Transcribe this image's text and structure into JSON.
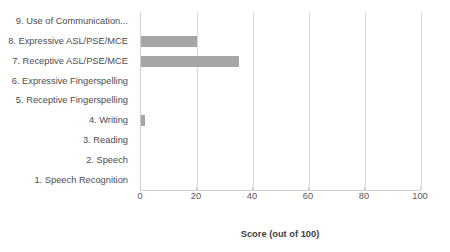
{
  "chart_data": {
    "type": "bar",
    "orientation": "horizontal",
    "title": "",
    "xlabel": "Score (out of 100)",
    "ylabel": "",
    "xlim": [
      0,
      100
    ],
    "xticks": [
      0,
      20,
      40,
      60,
      80,
      100
    ],
    "grid": true,
    "legend": false,
    "bar_color": "#a6a6a6",
    "categories": [
      "1. Speech Recognition",
      "2. Speech",
      "3. Reading",
      "4. Writing",
      "5. Receptive Fingerspelling",
      "6. Expressive Fingerspelling",
      "7. Receptive ASL/PSE/MCE",
      "8. Expressive ASL/PSE/MCE",
      "9. Use of Communication..."
    ],
    "values": [
      0,
      0,
      0,
      1.5,
      0,
      0,
      35,
      20,
      0
    ]
  },
  "axis": {
    "title": "Score (out of 100)",
    "ticks": [
      "0",
      "20",
      "40",
      "60",
      "80",
      "100"
    ]
  },
  "categories_top_down": [
    "9. Use of Communication...",
    "8. Expressive ASL/PSE/MCE",
    "7. Receptive ASL/PSE/MCE",
    "6. Expressive Fingerspelling",
    "5. Receptive Fingerspelling",
    "4. Writing",
    "3. Reading",
    "2. Speech",
    "1. Speech Recognition"
  ],
  "values_top_down": [
    0,
    20,
    35,
    0,
    0,
    1.5,
    0,
    0,
    0
  ]
}
